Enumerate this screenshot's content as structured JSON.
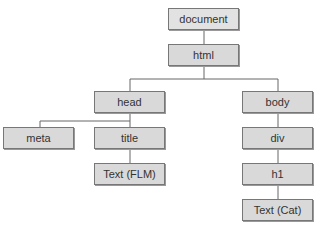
{
  "tree": {
    "nodes": {
      "document": "document",
      "html": "html",
      "head": "head",
      "body": "body",
      "meta": "meta",
      "title": "title",
      "text_flm": "Text (FLM)",
      "div": "div",
      "h1": "h1",
      "text_cat": "Text (Cat)"
    },
    "edges": [
      [
        "document",
        "html"
      ],
      [
        "html",
        "head"
      ],
      [
        "html",
        "body"
      ],
      [
        "head",
        "meta"
      ],
      [
        "head",
        "title"
      ],
      [
        "title",
        "text_flm"
      ],
      [
        "body",
        "div"
      ],
      [
        "div",
        "h1"
      ],
      [
        "h1",
        "text_cat"
      ]
    ]
  }
}
